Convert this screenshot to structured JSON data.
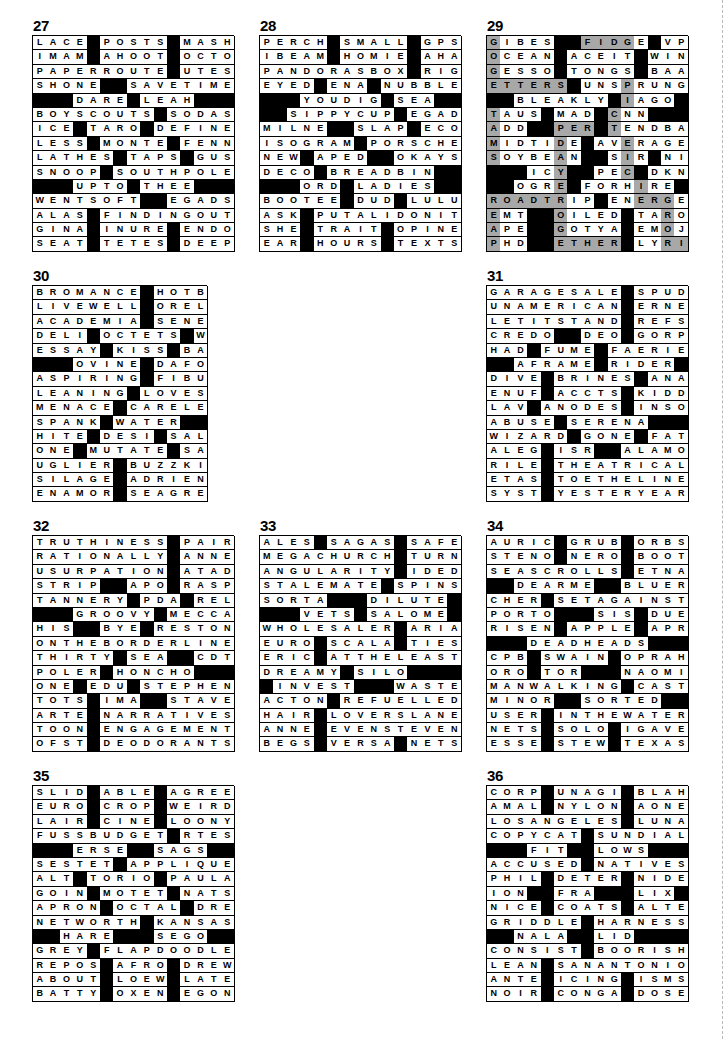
{
  "page": {
    "block_char": "#",
    "shade_marker": "*",
    "colors": {
      "block": "#000000",
      "shade": "#a8a8a8",
      "cell": "#ffffff",
      "text": "#000000"
    }
  },
  "puzzles": [
    {
      "number": "27",
      "cols": 15,
      "rows": 15,
      "grid": [
        "LACE#POSTS#MASH",
        "IMAM#AHOOT#OCTO",
        "PAPERROUTE#UTES",
        "SHONE##SAVETIME",
        "###DARE#LEAH###",
        "BOYSCOUTS#SODAS",
        "ICE#TARO#DEFINE",
        "LESS#MONTE#FENN",
        "LATHES#TAPS#GUS",
        "SNOOP#SOUTHPOLE",
        "###UPTO#THEE###",
        "WENTSOFT##EGADS",
        "ALAS#FINDINGOUT",
        "GINA#INURE#ENDO",
        "SEAT#TETES#DEEP"
      ]
    },
    {
      "number": "28",
      "cols": 15,
      "rows": 15,
      "grid": [
        "PERCH#SMALL#GPS",
        "IBEAM#HOMIE#AHA",
        "PANDORASBOX#RIG",
        "EYED#ENA#NUBBLE",
        "###YOUDIG#SEA##",
        "##SIPPYCUP#EGAD",
        "MILNE##SLAP#ECO",
        "ISOGRAM#PORSCHE",
        "NEW#APED##OKAYS",
        "DECO#BREADBIN##",
        "###ORD#LADIES##",
        "BOOTEE#DUD#LULU",
        "ASK#PUTALIDONIT",
        "SHE#TRAIT#OPINE",
        "EAR#HOURS#TEXTS"
      ]
    },
    {
      "number": "29",
      "cols": 15,
      "rows": 15,
      "grid": [
        "GIBES##FIDGE#VPS",
        "OCEAN#ACEIT#WIN",
        "GESSO#TONGS#BAA",
        "ETTERS#UNSPRUNG",
        "##BLEAKLY#IAGO#",
        "TAUS#MAD#CNN###",
        "ADD##PER#TENDBAR",
        "MIDTIDE#AVERAGE",
        "SOYBEAN##SIR#NIL",
        "###ICY##PEC#DKNY",
        "##OGRE#FORHIRE#",
        "ROADTRIP#ENERGE",
        "EMT##OILED#TAROT",
        "APE##GOTYA#EMOJI",
        "PHD##ETHER#LYRIC"
      ],
      "grid_fixed": [
        "GIBES##FIDGE#VP",
        "OCEAN#ACEIT#WIN",
        "GESSO#TONGS#BAA",
        "ETTERS#UNSPRUNG",
        "##BLEAKLY#IAGO#",
        "TAUS#MAD#CNN###",
        "ADD##PER#TENDBA",
        "MIDTIDE#AVERAGE",
        "SOYBEAN##SIR#NI",
        "###ICY##PEC#DKN",
        "##OGRE#FORHIRE#",
        "ROADTRIP#ENERGE",
        "EMT##OILED#TARO",
        "APE##GOTYA#EMOJ",
        "PHD##ETHER#LYRI"
      ],
      "shaded_cells": [
        [
          0,
          0
        ],
        [
          0,
          6
        ],
        [
          0,
          7
        ],
        [
          0,
          8
        ],
        [
          0,
          9
        ],
        [
          0,
          10
        ],
        [
          1,
          0
        ],
        [
          1,
          11
        ],
        [
          2,
          0
        ],
        [
          2,
          11
        ],
        [
          3,
          0
        ],
        [
          3,
          1
        ],
        [
          3,
          2
        ],
        [
          3,
          3
        ],
        [
          3,
          4
        ],
        [
          3,
          5
        ],
        [
          3,
          10
        ],
        [
          4,
          0
        ],
        [
          4,
          10
        ],
        [
          5,
          0
        ],
        [
          5,
          9
        ],
        [
          6,
          0
        ],
        [
          6,
          5
        ],
        [
          6,
          6
        ],
        [
          6,
          7
        ],
        [
          6,
          8
        ],
        [
          6,
          9
        ],
        [
          7,
          0
        ],
        [
          7,
          5
        ],
        [
          7,
          10
        ],
        [
          8,
          0
        ],
        [
          8,
          5
        ],
        [
          8,
          10
        ],
        [
          9,
          0
        ],
        [
          9,
          5
        ],
        [
          9,
          10
        ],
        [
          9,
          11
        ],
        [
          10,
          0
        ],
        [
          10,
          5
        ],
        [
          10,
          11
        ],
        [
          11,
          0
        ],
        [
          11,
          1
        ],
        [
          11,
          2
        ],
        [
          11,
          3
        ],
        [
          11,
          4
        ],
        [
          11,
          5
        ],
        [
          11,
          11
        ],
        [
          11,
          12
        ],
        [
          11,
          13
        ],
        [
          12,
          0
        ],
        [
          12,
          5
        ],
        [
          12,
          13
        ],
        [
          13,
          0
        ],
        [
          13,
          5
        ],
        [
          13,
          13
        ],
        [
          14,
          0
        ],
        [
          14,
          5
        ],
        [
          14,
          6
        ],
        [
          14,
          7
        ],
        [
          14,
          8
        ],
        [
          14,
          9
        ],
        [
          14,
          13
        ],
        [
          14,
          14
        ]
      ]
    },
    {
      "number": "30",
      "cols": 13,
      "rows": 15,
      "grid": [
        "BROMANCE#HOTBED",
        "LIVEWELL#ORELSE",
        "ACADEMIA#SENECA",
        "DELI#OCTETS#WAD",
        "ESSAY#KISS#BARB",
        "###OVINE#DAFOE",
        "ASPIRING#FIBULA",
        "LEANING#LOVESET",
        "MENACE#CARELESS",
        "SPANK#WATER####",
        "HITE#DESI#SALMA",
        "ONE#MUTATE#SAIL",
        "UGLIER#BUZZKILL",
        "SILAGE#ADRIENNE",
        "ENAMOR#SEAGREEN"
      ]
    },
    {
      "number": "31",
      "cols": 15,
      "rows": 15,
      "grid": [
        "GARAGESALE#SPUD",
        "UNAMERICAN#ERNE",
        "LETITSTAND#REFS",
        "CREDO##DEO#GORP",
        "HAD#FUME#FAERIE",
        "##AFRAME#RIDER",
        "DIVE#BRINES#ANA",
        "ENUF#ACCTS#KIDD",
        "LAV#ANODES#INSO",
        "ABUSE#SERENA###",
        "WIZARD#GONE#FAT",
        "ALEG#ISR##ALAMO",
        "RILE#THEATRICAL",
        "ETAS#TOETHELINE",
        "SYST#YESTERYEAR"
      ]
    },
    {
      "number": "32",
      "cols": 15,
      "rows": 15,
      "grid": [
        "TRUTHINESS#PAIR",
        "RATIONALLY#ANNE",
        "USURPATION#ATAD",
        "STRIP##APO#RASP",
        "TANNERY#PDA#REL",
        "###GROOVY#MECCA",
        "HIS##BYE#RESTON",
        "ONTHEBORDERLINE",
        "THIRTY#SEA##CDT",
        "POLER#HONCHO###",
        "ONE#EDU#STEPHEN",
        "TOTS#IMA##STAVE",
        "ARTE#NARRATIVES",
        "TOON#ENGAGEMENT",
        "OFST#DEODORANTS"
      ]
    },
    {
      "number": "33",
      "cols": 15,
      "rows": 15,
      "grid": [
        "ALES#SAGAS#SAFE",
        "MEGACHURCH#TURN",
        "ANGULARITY#IDED",
        "STALEMATE#SPINS",
        "SORTA###DILUTE#",
        "###VETS#SALOME",
        "WHOLESALER#ARIA",
        "EURO#SCALA#TIES",
        "ERIC#ATTHELEAST",
        "DREAMY#SILO####",
        "#INVEST###WASTE",
        "ACTON#REFUELLED",
        "HAIR#LOVERSLANE",
        "ANNE#EVENSTEVEN",
        "BEGS#VERSA#NETS"
      ]
    },
    {
      "number": "34",
      "cols": 15,
      "rows": 15,
      "grid": [
        "AURIC#GRUB#ORBS",
        "STENO#NERO#BOOT",
        "SEASCROLLS#ETNA",
        "##DEARME##BLUER",
        "CHER#SETAGAINST",
        "PORTO###SIS#DUE",
        "RISEN#APPLE#APR",
        "###DEADHEADS###",
        "CPB#SWAIN#OPRAH",
        "ORO#TOR###NAOMI",
        "MANWALKING#CAST",
        "MINOR##SORTED##",
        "USER#INTHEWATER",
        "NETS#SOLO#IGAVE",
        "ESSE#STEW#TEXAS"
      ]
    },
    {
      "number": "35",
      "cols": 15,
      "rows": 15,
      "grid": [
        "SLID#ABLE#AGREE",
        "EURO#CROP#WEIRD",
        "LAIR#CINE#LOONY",
        "FUSSBUDGET#RTES",
        "###ERSE##SAGS##",
        "SESTET#APPLIQUE",
        "ALT#TORIO#PAULA",
        "GOIN#MOTET#NATS",
        "APRON#OCTAL#DRE",
        "NETWORTH#KANSAS",
        "##HARE###SEGO##",
        "GREY#FLAPDOODLE",
        "REPOS#AFRO#DREW",
        "ABOUT#LOEW#LATE",
        "BATTY#OXEN#EGON"
      ]
    },
    {
      "number": "36",
      "cols": 15,
      "rows": 15,
      "grid": [
        "CORP#UNAGI#BLAH",
        "AMAL#NYLON#AONE",
        "LOSANGELES#LUNA",
        "COPYCAT#SUNDIAL",
        "###FIT##LOWS###",
        "ACCUSED#NATIVES",
        "PHIL#DETER#NIDE",
        "ION##FRA###LIX",
        "NICE#COATS#ALTE",
        "GRIDDLE#HARNESS",
        "##NALA##LID####",
        "CONSIST#BOORISH",
        "LEAN#SANANTONIO",
        "ANTE#ICING#ISMS",
        "NOIR#CONGA#DOSE"
      ]
    }
  ]
}
